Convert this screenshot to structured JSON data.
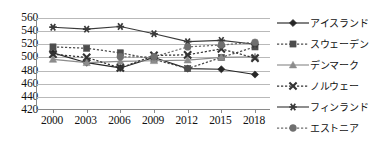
{
  "chart_data": {
    "type": "line",
    "title": "",
    "xlabel": "",
    "ylabel": "",
    "categories": [
      "2000",
      "2003",
      "2006",
      "2009",
      "2012",
      "2015",
      "2018"
    ],
    "ylim": [
      420,
      560
    ],
    "ytick_step": 20,
    "yticks": [
      420,
      440,
      460,
      480,
      500,
      520,
      540,
      560
    ],
    "grid": true,
    "legend_position": "right",
    "series": [
      {
        "name": "アイスランド",
        "marker": "diamond",
        "line_style": "solid",
        "color": "#262626",
        "values": [
          507,
          492,
          484,
          500,
          483,
          482,
          474
        ]
      },
      {
        "name": "スウェーデン",
        "marker": "square",
        "line_style": "dotted",
        "color": "#4d4d4d",
        "values": [
          516,
          514,
          507,
          497,
          483,
          500,
          516
        ]
      },
      {
        "name": "デンマーク",
        "marker": "triangle",
        "line_style": "solid",
        "color": "#8c8c8c",
        "values": [
          497,
          492,
          494,
          495,
          496,
          500,
          501
        ]
      },
      {
        "name": "ノルウェー",
        "marker": "cross",
        "line_style": "dotted",
        "color": "#333333",
        "values": [
          505,
          500,
          484,
          503,
          504,
          513,
          499
        ]
      },
      {
        "name": "フィンランド",
        "marker": "asterisk",
        "line_style": "solid",
        "color": "#3a3a3a",
        "values": [
          546,
          543,
          547,
          536,
          524,
          526,
          520
        ]
      },
      {
        "name": "エストニア",
        "marker": "circle",
        "line_style": "dotted",
        "color": "#6f6f6f",
        "values": [
          null,
          null,
          501,
          501,
          516,
          519,
          523
        ]
      }
    ]
  },
  "axis": {
    "y_labels": [
      "560",
      "540",
      "520",
      "500",
      "480",
      "460",
      "440",
      "420"
    ],
    "x_labels": [
      "2000",
      "2003",
      "2006",
      "2009",
      "2012",
      "2015",
      "2018"
    ]
  },
  "legend": {
    "items": [
      {
        "label": "アイスランド"
      },
      {
        "label": "スウェーデン"
      },
      {
        "label": "デンマーク"
      },
      {
        "label": "ノルウェー"
      },
      {
        "label": "フィンランド"
      },
      {
        "label": "エストニア"
      }
    ]
  }
}
